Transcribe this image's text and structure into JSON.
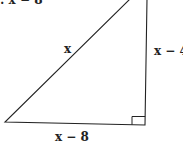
{
  "diagram": {
    "type": "right-triangle",
    "top_label_cropped": ": x − 8",
    "hypotenuse_label": "x",
    "vertical_leg_label": "x − 4",
    "horizontal_leg_label": "x − 8",
    "right_angle_marker": "bottom-right",
    "colors": {
      "stroke": "#222222",
      "background": "#ffffff"
    }
  }
}
